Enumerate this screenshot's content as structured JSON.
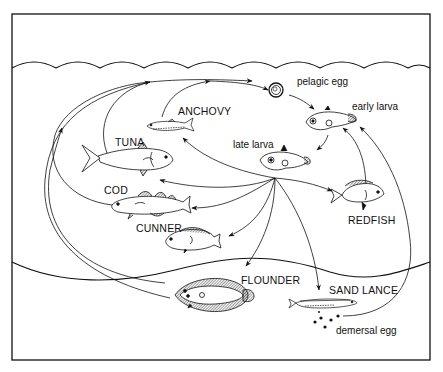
{
  "diagram": {
    "title": "",
    "stages": {
      "pelagic_egg": "pelagic egg",
      "early_larva": "early larva",
      "late_larva": "late larva",
      "demersal_egg": "demersal egg"
    },
    "species": {
      "anchovy": "ANCHOVY",
      "tuna": "TUNA",
      "cod": "COD",
      "cunner": "CUNNER",
      "redfish": "REDFISH",
      "flounder": "FLOUNDER",
      "sand_lance": "SAND LANCE"
    },
    "colors": {
      "ink": "#111111",
      "background": "#ffffff"
    },
    "flows": [
      {
        "from": "pelagic egg",
        "to": "early larva"
      },
      {
        "from": "early larva",
        "to": "late larva"
      },
      {
        "from": "late larva",
        "to": "ANCHOVY"
      },
      {
        "from": "late larva",
        "to": "TUNA"
      },
      {
        "from": "late larva",
        "to": "COD"
      },
      {
        "from": "late larva",
        "to": "CUNNER"
      },
      {
        "from": "late larva",
        "to": "FLOUNDER"
      },
      {
        "from": "late larva",
        "to": "SAND LANCE"
      },
      {
        "from": "late larva",
        "to": "REDFISH"
      },
      {
        "from": "ANCHOVY",
        "to": "pelagic egg"
      },
      {
        "from": "TUNA",
        "to": "pelagic egg"
      },
      {
        "from": "COD",
        "to": "pelagic egg"
      },
      {
        "from": "CUNNER",
        "to": "pelagic egg"
      },
      {
        "from": "FLOUNDER",
        "to": "pelagic egg"
      },
      {
        "from": "REDFISH",
        "to": "early larva"
      },
      {
        "from": "SAND LANCE",
        "to": "demersal egg"
      },
      {
        "from": "demersal egg",
        "to": "early larva"
      }
    ]
  }
}
